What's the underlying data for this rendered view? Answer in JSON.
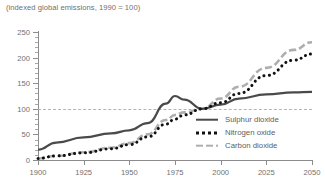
{
  "chart_data": {
    "type": "line",
    "title": "(indexed global emissions, 1990 = 100)",
    "xlabel": "",
    "ylabel": "",
    "xlim": [
      1900,
      2050
    ],
    "ylim": [
      0,
      250
    ],
    "yticks": [
      0,
      50,
      100,
      150,
      200,
      250
    ],
    "xticks": [
      1900,
      1925,
      1950,
      1975,
      2000,
      2025,
      2050
    ],
    "grid": false,
    "legend_position": "bottom-right",
    "reference_line": {
      "value": 100,
      "style": "dashed",
      "label": "1990 = 100"
    },
    "x": [
      1900,
      1910,
      1925,
      1940,
      1950,
      1960,
      1970,
      1975,
      1980,
      1990,
      2000,
      2010,
      2025,
      2040,
      2050
    ],
    "series": [
      {
        "name": "Sulphur dioxide",
        "color": "#4a4a4a",
        "style": "solid",
        "values": [
          20,
          34,
          44,
          52,
          58,
          72,
          110,
          125,
          118,
          100,
          108,
          120,
          128,
          132,
          133
        ]
      },
      {
        "name": "Nitrogen oxide",
        "color": "#121212",
        "style": "dotted",
        "values": [
          3,
          8,
          14,
          22,
          30,
          45,
          70,
          80,
          88,
          100,
          112,
          130,
          165,
          195,
          207
        ]
      },
      {
        "name": "Carbon dioxide",
        "color": "#aeaeae",
        "style": "dashed",
        "values": [
          3,
          8,
          15,
          24,
          33,
          50,
          78,
          88,
          93,
          100,
          120,
          143,
          180,
          215,
          230
        ]
      }
    ]
  },
  "legend": {
    "items": [
      {
        "label": "Sulphur dioxide",
        "marker": "solid-line-marker"
      },
      {
        "label": "Nitrogen oxide",
        "marker": "dotted-line-marker"
      },
      {
        "label": "Carbon dioxide",
        "marker": "dashed-line-marker"
      }
    ]
  }
}
